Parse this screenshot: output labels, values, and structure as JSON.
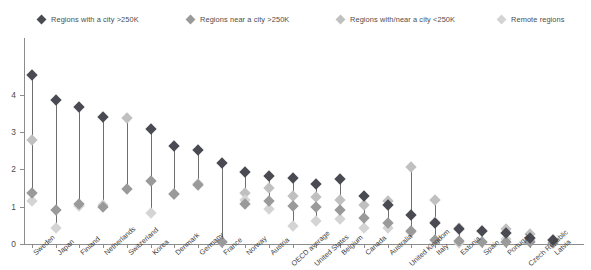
{
  "legend": {
    "items": [
      {
        "label": "Regions with a city >250K",
        "color": "#4a4a52",
        "x": 38,
        "icon": "diamond-marker-icon"
      },
      {
        "label": "Regions near a city >250K",
        "color": "#9a9a9a",
        "x": 187,
        "icon": "diamond-marker-icon"
      },
      {
        "label": "Regions with/near a city <250K",
        "color": "#c0c0c0",
        "x": 337,
        "icon": "diamond-marker-icon"
      },
      {
        "label": "Remote regions",
        "color": "#d4d4d4",
        "x": 498,
        "icon": "diamond-marker-icon"
      }
    ]
  },
  "axes": {
    "y_ticks": [
      "0",
      "1",
      "2",
      "3",
      "4"
    ],
    "y_values": [
      0,
      1,
      2,
      3,
      4
    ],
    "x_labels": [
      "Sweden",
      "Japan",
      "Finland",
      "Netherlands",
      "Switzerland",
      "Korea",
      "Denmark",
      "Germany",
      "France",
      "Norway",
      "Austria",
      "OECD average",
      "United States",
      "Belgium",
      "Canada",
      "Australia",
      "United Kingdom",
      "Italy",
      "Estonia",
      "Spain",
      "Portugal",
      "Czech Republic",
      "Latvia"
    ]
  },
  "chart_data": {
    "type": "scatter",
    "title": "",
    "subtitle": "",
    "xlabel": "",
    "ylabel": "",
    "ylim": [
      0,
      4.7
    ],
    "grid": false,
    "legend_position": "top",
    "categories": [
      "Sweden",
      "Japan",
      "Finland",
      "Netherlands",
      "Switzerland",
      "Korea",
      "Denmark",
      "Germany",
      "France",
      "Norway",
      "Austria",
      "OECD average",
      "United States",
      "Belgium",
      "Canada",
      "Australia",
      "United Kingdom",
      "Italy",
      "Estonia",
      "Spain",
      "Portugal",
      "Czech Republic",
      "Latvia"
    ],
    "series": [
      {
        "name": "Regions with a city >250K",
        "color": "#4a4a52",
        "values": [
          4.52,
          3.86,
          3.66,
          3.4,
          null,
          3.08,
          2.63,
          2.52,
          2.16,
          1.92,
          1.82,
          1.78,
          1.6,
          1.74,
          1.3,
          1.04,
          0.78,
          0.56,
          0.4,
          0.34,
          0.3,
          0.16,
          0.1
        ]
      },
      {
        "name": "Regions near a city >250K",
        "color": "#9a9a9a",
        "values": [
          1.36,
          0.91,
          1.06,
          1.0,
          1.48,
          1.68,
          1.34,
          1.59,
          0.06,
          1.06,
          1.15,
          1.02,
          1.0,
          0.91,
          0.7,
          0.57,
          0.36,
          0.1,
          0.07,
          0.06,
          0.06,
          0.05,
          0.04
        ]
      },
      {
        "name": "Regions with/near a city <250K",
        "color": "#c0c0c0",
        "values": [
          2.78,
          null,
          null,
          null,
          3.38,
          null,
          1.34,
          1.62,
          null,
          1.38,
          1.5,
          1.3,
          1.27,
          1.19,
          1.04,
          1.16,
          2.06,
          1.18,
          0.44,
          0.34,
          0.4,
          0.26,
          0.12
        ]
      },
      {
        "name": "Remote regions",
        "color": "#d4d4d4",
        "values": [
          1.15,
          0.43,
          1.01,
          1.05,
          null,
          0.82,
          null,
          null,
          0.06,
          1.18,
          0.95,
          0.47,
          0.62,
          0.66,
          0.42,
          0.43,
          0.33,
          0.58,
          0.04,
          0.05,
          0.14,
          0.11,
          0.06
        ]
      }
    ]
  }
}
